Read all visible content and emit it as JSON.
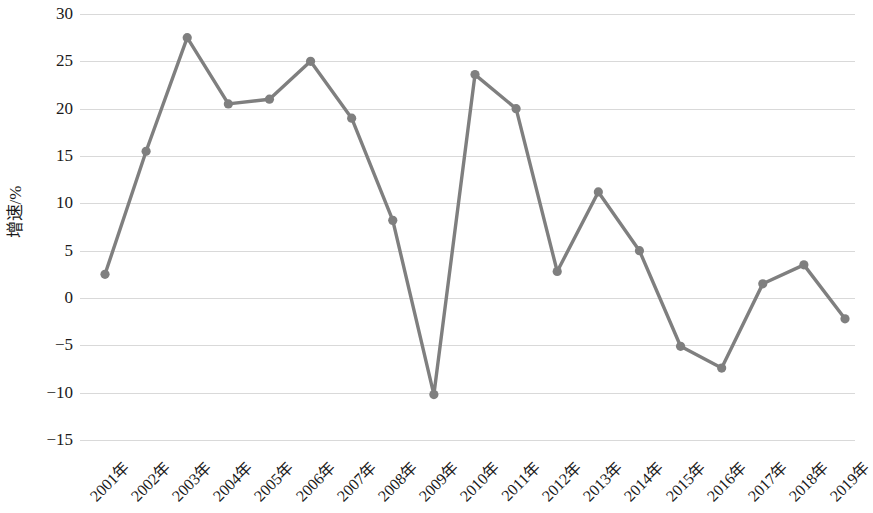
{
  "chart_data": {
    "type": "line",
    "title": "",
    "subtitle": "",
    "xlabel": "",
    "ylabel": "增速/%",
    "categories": [
      "2001年",
      "2002年",
      "2003年",
      "2004年",
      "2005年",
      "2006年",
      "2007年",
      "2008年",
      "2009年",
      "2010年",
      "2011年",
      "2012年",
      "2013年",
      "2014年",
      "2015年",
      "2016年",
      "2017年",
      "2018年",
      "2019年"
    ],
    "values": [
      2.5,
      15.5,
      27.5,
      20.5,
      21.0,
      25.0,
      19.0,
      8.2,
      -10.2,
      23.6,
      20.0,
      2.8,
      11.2,
      5.0,
      -5.1,
      -7.4,
      1.5,
      3.5,
      -2.2
    ],
    "series": [
      {
        "name": "增速",
        "values": [
          2.5,
          15.5,
          27.5,
          20.5,
          21.0,
          25.0,
          19.0,
          8.2,
          -10.2,
          23.6,
          20.0,
          2.8,
          11.2,
          5.0,
          -5.1,
          -7.4,
          1.5,
          3.5,
          -2.2
        ]
      }
    ],
    "ylim": [
      -15,
      30
    ],
    "yticks": [
      30,
      25,
      20,
      15,
      10,
      5,
      0,
      -5,
      -10,
      -15
    ],
    "ytick_labels": [
      "30",
      "25",
      "20",
      "15",
      "10",
      "5",
      "0",
      "−5",
      "−10",
      "−15"
    ],
    "grid": true,
    "legend": false,
    "legend_position": "none",
    "marker": "circle",
    "colors": {
      "line": "#7f7f7f",
      "marker": "#7f7f7f",
      "grid": "#d9d9d9",
      "text": "#1a1a1a",
      "background": "#ffffff"
    }
  }
}
